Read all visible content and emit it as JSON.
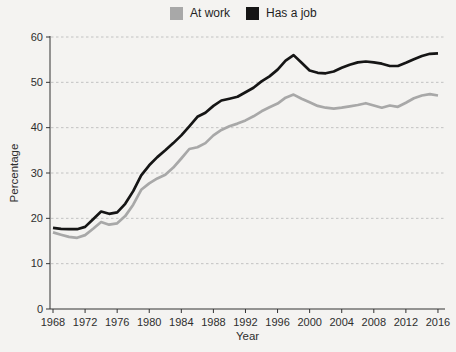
{
  "legend": {
    "items": [
      {
        "label": "At work",
        "color": "#a8a8a8"
      },
      {
        "label": "Has a job",
        "color": "#151515"
      }
    ]
  },
  "axes": {
    "x_label": "Year",
    "y_label": "Percentage"
  },
  "colors": {
    "background": "#f4f3f1",
    "grid": "#c2c2c2",
    "axis": "#333333",
    "tick_text": "#2e2e2e",
    "at_work_line": "#a8a8a8",
    "has_a_job_line": "#151515"
  },
  "chart_data": {
    "type": "line",
    "title": "",
    "xlabel": "Year",
    "ylabel": "Percentage",
    "ylim": [
      0,
      60
    ],
    "y_ticks": [
      0,
      10,
      20,
      30,
      40,
      50,
      60
    ],
    "x_ticks": [
      1968,
      1972,
      1976,
      1980,
      1984,
      1988,
      1992,
      1996,
      2000,
      2004,
      2008,
      2012,
      2016
    ],
    "grid": "horizontal-dashed",
    "legend_position": "top-center",
    "x": [
      1968,
      1969,
      1970,
      1971,
      1972,
      1973,
      1974,
      1975,
      1976,
      1977,
      1978,
      1979,
      1980,
      1981,
      1982,
      1983,
      1984,
      1985,
      1986,
      1987,
      1988,
      1989,
      1990,
      1991,
      1992,
      1993,
      1994,
      1995,
      1996,
      1997,
      1998,
      1999,
      2000,
      2001,
      2002,
      2003,
      2004,
      2005,
      2006,
      2007,
      2008,
      2009,
      2010,
      2011,
      2012,
      2013,
      2014,
      2015,
      2016
    ],
    "series": [
      {
        "name": "At work",
        "color": "#a8a8a8",
        "values": [
          16.9,
          16.4,
          15.9,
          15.7,
          16.3,
          17.7,
          19.2,
          18.6,
          18.9,
          20.5,
          23.0,
          26.3,
          27.7,
          28.8,
          29.6,
          31.2,
          33.2,
          35.3,
          35.7,
          36.6,
          38.3,
          39.5,
          40.3,
          40.9,
          41.6,
          42.5,
          43.6,
          44.5,
          45.3,
          46.6,
          47.3,
          46.4,
          45.6,
          44.8,
          44.4,
          44.2,
          44.4,
          44.7,
          45.0,
          45.4,
          44.9,
          44.4,
          44.9,
          44.6,
          45.5,
          46.5,
          47.1,
          47.4,
          47.1
        ]
      },
      {
        "name": "Has a job",
        "color": "#151515",
        "values": [
          17.9,
          17.7,
          17.6,
          17.6,
          18.1,
          19.8,
          21.5,
          21.0,
          21.3,
          23.2,
          26.0,
          29.5,
          31.7,
          33.5,
          35.0,
          36.6,
          38.3,
          40.3,
          42.4,
          43.3,
          44.8,
          46.0,
          46.4,
          46.8,
          47.8,
          48.8,
          50.2,
          51.3,
          52.8,
          54.8,
          56.0,
          54.3,
          52.6,
          52.1,
          52.0,
          52.4,
          53.2,
          53.9,
          54.4,
          54.6,
          54.4,
          54.1,
          53.6,
          53.6,
          54.3,
          55.1,
          55.8,
          56.3,
          56.4
        ]
      }
    ]
  }
}
